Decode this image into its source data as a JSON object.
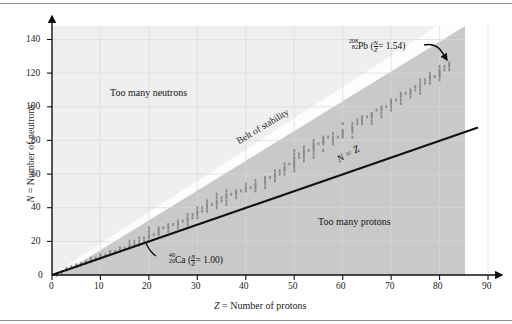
{
  "figure": {
    "kind": "belt-of-stability-scatter"
  },
  "axes": {
    "x": {
      "label": "Z = Number of protons",
      "label_italic_prefix": "Z",
      "label_rest": " = Number of protons",
      "ticks": [
        0,
        10,
        20,
        30,
        40,
        50,
        60,
        70,
        80,
        90
      ],
      "min": 0,
      "max": 93
    },
    "y": {
      "label": "N = Number of neutrons",
      "label_italic_prefix": "N",
      "label_rest": " = Number of neutrons",
      "ticks": [
        20,
        40,
        60,
        80,
        100,
        120,
        140
      ],
      "zero_tick": "0",
      "min": 0,
      "max": 148
    }
  },
  "annotations": {
    "too_many_neutrons": "Too many neutrons",
    "too_many_protons": "Too many protons",
    "belt_of_stability": "Belt of stability",
    "n_equals_z": "N = Z",
    "lead": {
      "mass_number": "208",
      "atomic_number": "82",
      "symbol": "Pb",
      "ratio_open": "(",
      "ratio_numerator": "N",
      "ratio_denominator": "Z",
      "ratio_equals": "= 1.54",
      "ratio_close": ")",
      "full": "208/82 Pb (N/Z = 1.54)"
    },
    "calcium": {
      "mass_number": "40",
      "atomic_number": "20",
      "symbol": "Ca",
      "ratio_open": "(",
      "ratio_numerator": "N",
      "ratio_denominator": "Z",
      "ratio_equals": "= 1.00",
      "ratio_close": ")",
      "full": "40/20 Ca (N/Z = 1.00)"
    }
  },
  "colors": {
    "upper_region": "#efefef",
    "lower_region": "#c9c9c9",
    "stability_band": "#fdfdfd",
    "grid": "#d8d8d8",
    "axis": "#111111",
    "dot": "#8a8a8a",
    "line": "#111111",
    "frame": "#8d8d8d"
  },
  "chart_data": {
    "type": "scatter",
    "title": "",
    "xlabel": "Z = Number of protons",
    "ylabel": "N = Number of neutrons",
    "xlim": [
      0,
      93
    ],
    "ylim": [
      0,
      148
    ],
    "xticks": [
      0,
      10,
      20,
      30,
      40,
      50,
      60,
      70,
      80,
      90
    ],
    "yticks": [
      0,
      20,
      40,
      60,
      80,
      100,
      120,
      140
    ],
    "grid": true,
    "legend": "none",
    "series": [
      {
        "name": "Stable nuclides (belt of stability)",
        "marker": "small square",
        "color": "#8a8a8a",
        "points": [
          [
            1,
            0
          ],
          [
            1,
            1
          ],
          [
            2,
            1
          ],
          [
            2,
            2
          ],
          [
            3,
            3
          ],
          [
            3,
            4
          ],
          [
            4,
            5
          ],
          [
            5,
            5
          ],
          [
            5,
            6
          ],
          [
            6,
            6
          ],
          [
            6,
            7
          ],
          [
            7,
            7
          ],
          [
            7,
            8
          ],
          [
            8,
            8
          ],
          [
            8,
            9
          ],
          [
            8,
            10
          ],
          [
            9,
            10
          ],
          [
            10,
            10
          ],
          [
            10,
            11
          ],
          [
            10,
            12
          ],
          [
            11,
            12
          ],
          [
            12,
            12
          ],
          [
            12,
            13
          ],
          [
            12,
            14
          ],
          [
            13,
            14
          ],
          [
            14,
            14
          ],
          [
            14,
            15
          ],
          [
            14,
            16
          ],
          [
            15,
            16
          ],
          [
            16,
            16
          ],
          [
            16,
            17
          ],
          [
            16,
            18
          ],
          [
            16,
            20
          ],
          [
            17,
            18
          ],
          [
            17,
            20
          ],
          [
            18,
            18
          ],
          [
            18,
            20
          ],
          [
            18,
            22
          ],
          [
            19,
            20
          ],
          [
            19,
            22
          ],
          [
            20,
            20
          ],
          [
            20,
            22
          ],
          [
            20,
            23
          ],
          [
            20,
            24
          ],
          [
            20,
            26
          ],
          [
            20,
            28
          ],
          [
            21,
            24
          ],
          [
            22,
            24
          ],
          [
            22,
            25
          ],
          [
            22,
            26
          ],
          [
            22,
            27
          ],
          [
            22,
            28
          ],
          [
            23,
            28
          ],
          [
            24,
            26
          ],
          [
            24,
            28
          ],
          [
            24,
            29
          ],
          [
            24,
            30
          ],
          [
            25,
            30
          ],
          [
            26,
            28
          ],
          [
            26,
            30
          ],
          [
            26,
            31
          ],
          [
            26,
            32
          ],
          [
            27,
            32
          ],
          [
            28,
            30
          ],
          [
            28,
            32
          ],
          [
            28,
            33
          ],
          [
            28,
            34
          ],
          [
            28,
            36
          ],
          [
            29,
            34
          ],
          [
            29,
            36
          ],
          [
            30,
            34
          ],
          [
            30,
            36
          ],
          [
            30,
            37
          ],
          [
            30,
            38
          ],
          [
            30,
            40
          ],
          [
            31,
            38
          ],
          [
            31,
            40
          ],
          [
            32,
            38
          ],
          [
            32,
            40
          ],
          [
            32,
            41
          ],
          [
            32,
            42
          ],
          [
            32,
            44
          ],
          [
            33,
            42
          ],
          [
            34,
            40
          ],
          [
            34,
            42
          ],
          [
            34,
            43
          ],
          [
            34,
            44
          ],
          [
            34,
            46
          ],
          [
            34,
            48
          ],
          [
            35,
            44
          ],
          [
            35,
            46
          ],
          [
            36,
            42
          ],
          [
            36,
            44
          ],
          [
            36,
            46
          ],
          [
            36,
            47
          ],
          [
            36,
            48
          ],
          [
            36,
            50
          ],
          [
            37,
            48
          ],
          [
            38,
            46
          ],
          [
            38,
            48
          ],
          [
            38,
            49
          ],
          [
            38,
            50
          ],
          [
            39,
            50
          ],
          [
            40,
            50
          ],
          [
            40,
            51
          ],
          [
            40,
            52
          ],
          [
            40,
            54
          ],
          [
            41,
            52
          ],
          [
            42,
            50
          ],
          [
            42,
            52
          ],
          [
            42,
            53
          ],
          [
            42,
            54
          ],
          [
            42,
            56
          ],
          [
            44,
            52
          ],
          [
            44,
            54
          ],
          [
            44,
            55
          ],
          [
            44,
            56
          ],
          [
            44,
            57
          ],
          [
            44,
            58
          ],
          [
            45,
            58
          ],
          [
            46,
            56
          ],
          [
            46,
            58
          ],
          [
            46,
            59
          ],
          [
            46,
            60
          ],
          [
            46,
            62
          ],
          [
            47,
            60
          ],
          [
            47,
            62
          ],
          [
            48,
            60
          ],
          [
            48,
            62
          ],
          [
            48,
            63
          ],
          [
            48,
            64
          ],
          [
            48,
            66
          ],
          [
            49,
            66
          ],
          [
            50,
            62
          ],
          [
            50,
            64
          ],
          [
            50,
            65
          ],
          [
            50,
            66
          ],
          [
            50,
            67
          ],
          [
            50,
            68
          ],
          [
            50,
            69
          ],
          [
            50,
            70
          ],
          [
            50,
            72
          ],
          [
            50,
            74
          ],
          [
            51,
            70
          ],
          [
            51,
            72
          ],
          [
            52,
            68
          ],
          [
            52,
            70
          ],
          [
            52,
            71
          ],
          [
            52,
            72
          ],
          [
            52,
            73
          ],
          [
            52,
            74
          ],
          [
            52,
            76
          ],
          [
            53,
            74
          ],
          [
            54,
            70
          ],
          [
            54,
            72
          ],
          [
            54,
            74
          ],
          [
            54,
            75
          ],
          [
            54,
            76
          ],
          [
            54,
            77
          ],
          [
            54,
            78
          ],
          [
            54,
            80
          ],
          [
            55,
            78
          ],
          [
            56,
            74
          ],
          [
            56,
            78
          ],
          [
            56,
            79
          ],
          [
            56,
            80
          ],
          [
            56,
            81
          ],
          [
            56,
            82
          ],
          [
            57,
            82
          ],
          [
            58,
            78
          ],
          [
            58,
            80
          ],
          [
            58,
            82
          ],
          [
            58,
            84
          ],
          [
            59,
            82
          ],
          [
            60,
            82
          ],
          [
            60,
            83
          ],
          [
            60,
            84
          ],
          [
            60,
            85
          ],
          [
            60,
            86
          ],
          [
            60,
            90
          ],
          [
            62,
            82
          ],
          [
            62,
            85
          ],
          [
            62,
            86
          ],
          [
            62,
            87
          ],
          [
            62,
            88
          ],
          [
            62,
            90
          ],
          [
            63,
            90
          ],
          [
            63,
            92
          ],
          [
            64,
            90
          ],
          [
            64,
            91
          ],
          [
            64,
            92
          ],
          [
            64,
            93
          ],
          [
            64,
            94
          ],
          [
            65,
            94
          ],
          [
            66,
            90
          ],
          [
            66,
            92
          ],
          [
            66,
            94
          ],
          [
            66,
            95
          ],
          [
            66,
            96
          ],
          [
            67,
            98
          ],
          [
            68,
            94
          ],
          [
            68,
            96
          ],
          [
            68,
            98
          ],
          [
            68,
            99
          ],
          [
            68,
            100
          ],
          [
            69,
            100
          ],
          [
            70,
            98
          ],
          [
            70,
            100
          ],
          [
            70,
            102
          ],
          [
            70,
            103
          ],
          [
            70,
            104
          ],
          [
            71,
            104
          ],
          [
            72,
            102
          ],
          [
            72,
            104
          ],
          [
            72,
            106
          ],
          [
            72,
            107
          ],
          [
            72,
            108
          ],
          [
            73,
            108
          ],
          [
            74,
            106
          ],
          [
            74,
            108
          ],
          [
            74,
            109
          ],
          [
            74,
            110
          ],
          [
            75,
            110
          ],
          [
            75,
            112
          ],
          [
            76,
            108
          ],
          [
            76,
            110
          ],
          [
            76,
            112
          ],
          [
            76,
            114
          ],
          [
            76,
            116
          ],
          [
            77,
            114
          ],
          [
            77,
            116
          ],
          [
            78,
            114
          ],
          [
            78,
            116
          ],
          [
            78,
            117
          ],
          [
            78,
            118
          ],
          [
            78,
            120
          ],
          [
            79,
            118
          ],
          [
            80,
            116
          ],
          [
            80,
            118
          ],
          [
            80,
            119
          ],
          [
            80,
            120
          ],
          [
            80,
            121
          ],
          [
            80,
            122
          ],
          [
            80,
            124
          ],
          [
            81,
            122
          ],
          [
            81,
            124
          ],
          [
            82,
            122
          ],
          [
            82,
            124
          ],
          [
            82,
            125
          ],
          [
            82,
            126
          ]
        ]
      },
      {
        "name": "N = Z reference line",
        "type": "line",
        "color": "#111111",
        "from": [
          0,
          0
        ],
        "to": [
          88,
          88
        ]
      }
    ],
    "annotations": [
      {
        "text": "Too many neutrons",
        "x": 24,
        "y": 92
      },
      {
        "text": "Too many protons",
        "x": 60,
        "y": 32
      },
      {
        "text": "Belt of stability",
        "x": 37,
        "y": 70,
        "rotation": -32
      },
      {
        "text": "N = Z",
        "x": 62,
        "y": 70,
        "rotation": -30
      },
      {
        "text": "208/82 Pb (N/Z = 1.54)",
        "x": 66,
        "y": 136,
        "points_to": [
          82,
          126
        ]
      },
      {
        "text": "40/20 Ca (N/Z = 1.00)",
        "x": 26,
        "y": 14,
        "points_to": [
          20,
          20
        ]
      }
    ]
  }
}
